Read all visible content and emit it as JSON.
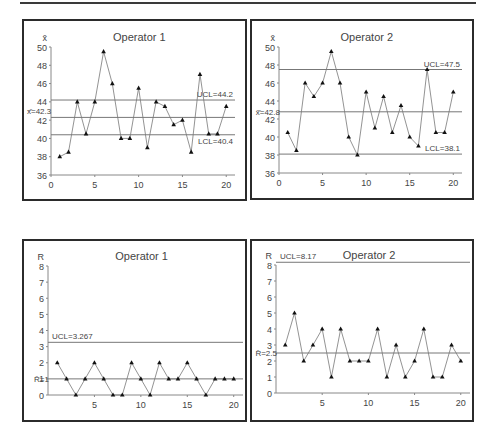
{
  "chart_data": [
    {
      "id": "xbar_op1",
      "type": "line",
      "chart_kind": "X-bar control chart",
      "title": "Operator 1",
      "ylabel": "x̄",
      "xlabel": "",
      "ylim": [
        36,
        50
      ],
      "xlim": [
        0,
        21
      ],
      "yticks": [
        36,
        38,
        40,
        42,
        44,
        46,
        48,
        50
      ],
      "xticks": [
        0,
        5,
        10,
        15,
        20
      ],
      "grid": false,
      "marker": "triangle",
      "x": [
        1,
        2,
        3,
        4,
        5,
        6,
        7,
        8,
        9,
        10,
        11,
        12,
        13,
        14,
        15,
        16,
        17,
        18,
        19,
        20
      ],
      "values": [
        38,
        38.5,
        44,
        40.5,
        44,
        49.5,
        46,
        40,
        40,
        45.5,
        39,
        44,
        43.5,
        41.5,
        42,
        38.5,
        47,
        40.5,
        40.5,
        43.5
      ],
      "control_lines": [
        {
          "name": "UCL",
          "value": 44.2,
          "label": "UCL=44.2",
          "label_pos": "right-above"
        },
        {
          "name": "CL",
          "value": 42.3,
          "label": "x̄̄=42.3",
          "label_pos": "left-above"
        },
        {
          "name": "LCL",
          "value": 40.4,
          "label": "LCL=40.4",
          "label_pos": "right-below"
        }
      ]
    },
    {
      "id": "xbar_op2",
      "type": "line",
      "chart_kind": "X-bar control chart",
      "title": "Operator 2",
      "ylabel": "x̄",
      "xlabel": "",
      "ylim": [
        36,
        50
      ],
      "xlim": [
        0,
        21
      ],
      "yticks": [
        36,
        38,
        40,
        42,
        44,
        46,
        48,
        50
      ],
      "xticks": [
        0,
        5,
        10,
        15,
        20
      ],
      "grid": false,
      "marker": "triangle",
      "x": [
        1,
        2,
        3,
        4,
        5,
        6,
        7,
        8,
        9,
        10,
        11,
        12,
        13,
        14,
        15,
        16,
        17,
        18,
        19,
        20
      ],
      "values": [
        40.5,
        38.5,
        46,
        44.5,
        46,
        49.5,
        46,
        40,
        38,
        45,
        41,
        44.5,
        40.5,
        43.5,
        40,
        39,
        47.5,
        40.5,
        40.5,
        45
      ],
      "control_lines": [
        {
          "name": "UCL",
          "value": 47.5,
          "label": "UCL=47.5",
          "label_pos": "right-above"
        },
        {
          "name": "CL",
          "value": 42.8,
          "label": "x̄̄=42.8",
          "label_pos": "axis"
        },
        {
          "name": "LCL",
          "value": 38.1,
          "label": "LCL=38.1",
          "label_pos": "right-above"
        }
      ]
    },
    {
      "id": "r_op1",
      "type": "line",
      "chart_kind": "R control chart",
      "title": "Operator 1",
      "ylabel": "R",
      "xlabel": "",
      "ylim": [
        0,
        8
      ],
      "xlim": [
        0,
        21
      ],
      "yticks": [
        0,
        1,
        2,
        3,
        4,
        5,
        6,
        7,
        8
      ],
      "xticks": [
        5,
        10,
        15,
        20
      ],
      "grid": false,
      "marker": "triangle",
      "x": [
        1,
        2,
        3,
        4,
        5,
        6,
        7,
        8,
        9,
        10,
        11,
        12,
        13,
        14,
        15,
        16,
        17,
        18,
        19,
        20
      ],
      "values": [
        2,
        1,
        0,
        1,
        2,
        1,
        0,
        0,
        2,
        1,
        0,
        2,
        1,
        1,
        2,
        1,
        0,
        1,
        1,
        1
      ],
      "control_lines": [
        {
          "name": "UCL",
          "value": 3.267,
          "label": "UCL=3.267",
          "label_pos": "left-above"
        },
        {
          "name": "CL",
          "value": 1,
          "label": "R̄=1",
          "label_pos": "axis"
        }
      ]
    },
    {
      "id": "r_op2",
      "type": "line",
      "chart_kind": "R control chart",
      "title": "Operator 2",
      "ylabel": "R",
      "xlabel": "",
      "ylim": [
        0,
        8
      ],
      "xlim": [
        0,
        21
      ],
      "yticks": [
        0,
        1,
        2,
        3,
        4,
        5,
        6,
        7,
        8
      ],
      "xticks": [
        5,
        10,
        15,
        20
      ],
      "grid": false,
      "marker": "triangle",
      "x": [
        1,
        2,
        3,
        4,
        5,
        6,
        7,
        8,
        9,
        10,
        11,
        12,
        13,
        14,
        15,
        16,
        17,
        18,
        19,
        20
      ],
      "values": [
        3,
        5,
        2,
        3,
        4,
        1,
        4,
        2,
        2,
        2,
        4,
        1,
        3,
        1,
        2,
        4,
        1,
        1,
        3,
        2
      ],
      "control_lines": [
        {
          "name": "UCL",
          "value": 8.17,
          "label": "UCL=8.17",
          "label_pos": "left-above"
        },
        {
          "name": "CL",
          "value": 2.5,
          "label": "R̄=2.5",
          "label_pos": "axis"
        }
      ]
    }
  ],
  "colors": {
    "frame": "#2b2b2b",
    "axis": "#888888",
    "data_line": "#777777",
    "marker": "#111111",
    "control_line": "#777777",
    "text": "#444444"
  }
}
